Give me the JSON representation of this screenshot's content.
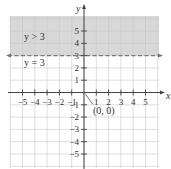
{
  "chart_data": {
    "type": "area",
    "title": "",
    "xlabel": "x",
    "ylabel": "y",
    "xlim": [
      -5.5,
      5.5
    ],
    "ylim": [
      -5.5,
      5.5
    ],
    "grid": true,
    "x_ticks": [
      -5,
      -4,
      -3,
      -2,
      -1,
      1,
      2,
      3,
      4,
      5
    ],
    "y_ticks": [
      -5,
      -4,
      -3,
      -2,
      -1,
      1,
      2,
      3,
      4,
      5
    ],
    "x_tick_labels": [
      "−5",
      "−4",
      "−3",
      "−2",
      "−1",
      "1",
      "2",
      "3",
      "4",
      "5"
    ],
    "y_tick_labels": [
      "−5",
      "−4",
      "−3",
      "−2",
      "−1",
      "1",
      "2",
      "3",
      "4",
      "5"
    ],
    "boundary_line": {
      "equation": "y = 3",
      "style": "dashed",
      "y": 3
    },
    "shaded_region": {
      "inequality": "y > 3",
      "y_from": 3,
      "y_to": 5.5
    },
    "annotations": [
      {
        "text": "y > 3",
        "x": -4,
        "y": 4
      },
      {
        "text": "y = 3",
        "x": -4,
        "y": 2.4
      },
      {
        "text": "(0, 0)",
        "x": 0.5,
        "y": -0.7,
        "pointer_to": [
          0,
          0
        ]
      }
    ],
    "colors": {
      "shade": "#d8d8d8",
      "grid": "#c8c8c8",
      "axis": "#444444",
      "dashed_line": "#777777"
    }
  }
}
